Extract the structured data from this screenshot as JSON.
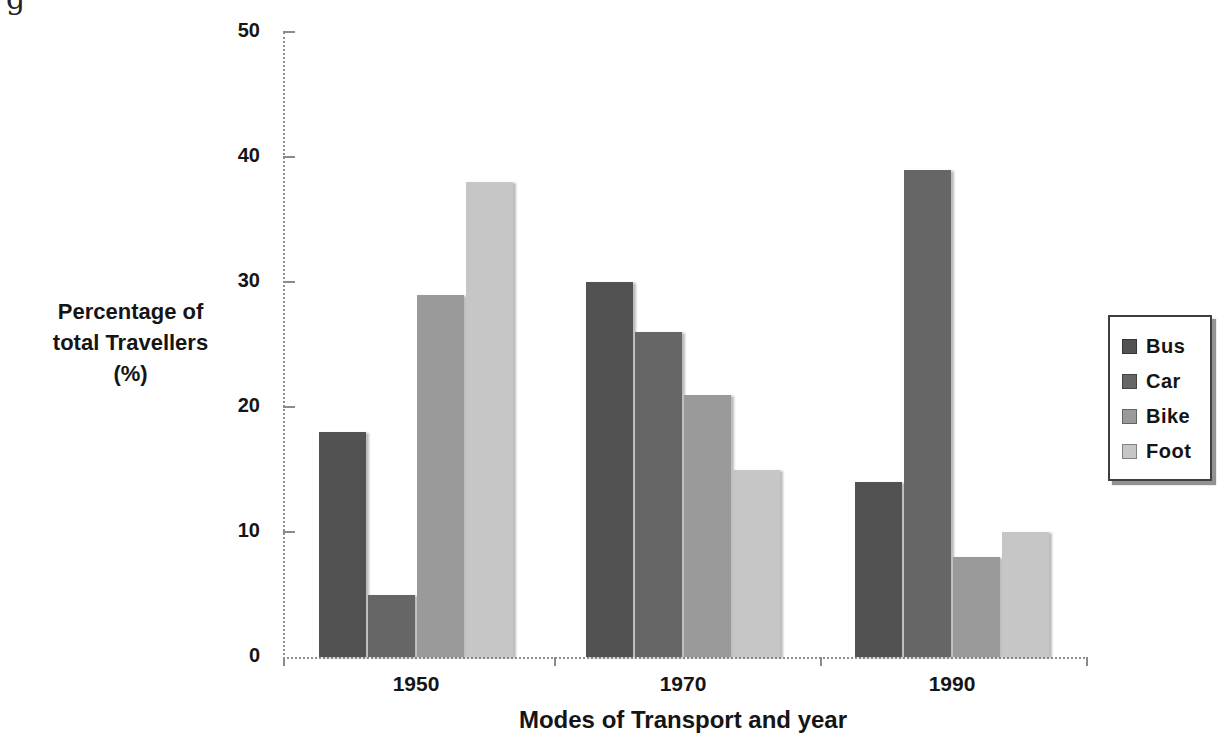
{
  "page": {
    "caption_fragment": "g"
  },
  "chart_data": {
    "type": "bar",
    "title": "",
    "xlabel": "Modes of Transport and year",
    "ylabel": "Percentage of total Travellers (%)",
    "ylabel_lines": [
      "Percentage of",
      "total Travellers",
      "(%)"
    ],
    "categories": [
      "1950",
      "1970",
      "1990"
    ],
    "series": [
      {
        "name": "Bus",
        "color": "#525252",
        "values": [
          18,
          30,
          14
        ]
      },
      {
        "name": "Car",
        "color": "#666666",
        "values": [
          5,
          26,
          39
        ]
      },
      {
        "name": "Bike",
        "color": "#9a9a9a",
        "values": [
          29,
          21,
          8
        ]
      },
      {
        "name": "Foot",
        "color": "#c6c6c6",
        "values": [
          38,
          15,
          10
        ]
      }
    ],
    "ylim": [
      0,
      50
    ],
    "yticks": [
      0,
      10,
      20,
      30,
      40,
      50
    ],
    "grid": false,
    "legend_position": "right",
    "legend_entries": [
      "Bus",
      "Car",
      "Bike",
      "Foot"
    ],
    "axis_color": "#8f8f8f"
  }
}
